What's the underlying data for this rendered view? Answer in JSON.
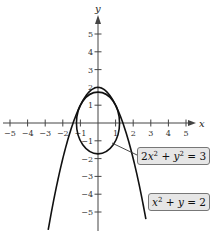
{
  "chart_data": {
    "type": "line",
    "title": "",
    "xlabel": "x",
    "ylabel": "y",
    "xlim": [
      -5,
      5
    ],
    "ylim": [
      -5,
      5
    ],
    "grid": false,
    "x_ticks": [
      -5,
      -4,
      -3,
      -2,
      -1,
      1,
      2,
      3,
      4,
      5
    ],
    "y_ticks": [
      5,
      4,
      3,
      2,
      1,
      -1,
      -2,
      -3,
      -4,
      -5
    ],
    "x_tick_labels": [
      "−5",
      "−4",
      "−3",
      "−2",
      "−1",
      "1",
      "2",
      "3",
      "4",
      "5"
    ],
    "y_tick_labels": [
      "5",
      "4",
      "3",
      "2",
      "1",
      "−1",
      "−2",
      "−3",
      "−4",
      "−5"
    ],
    "series": [
      {
        "name": "ellipse",
        "equation": "2x^2 + y^2 = 3",
        "kind": "ellipse",
        "semi_axis_x": 1.2247,
        "semi_axis_y": 1.7321
      },
      {
        "name": "parabola",
        "equation": "x^2 + y = 2",
        "kind": "parabola",
        "vertex": [
          0,
          2
        ],
        "x_range": [
          -2.83,
          2.72
        ]
      }
    ],
    "intersections": [
      [
        -1,
        1
      ],
      [
        1,
        1
      ]
    ],
    "annotations": [
      {
        "text": "2x² + y² = 3",
        "target": "ellipse"
      },
      {
        "text": "x² + y = 2",
        "target": "parabola"
      }
    ]
  },
  "labels": {
    "x_axis": "x",
    "y_axis": "y",
    "ellipse_label": {
      "a": "2",
      "x": "x",
      "exp1": "2",
      "plus": " + ",
      "y": "y",
      "exp2": "2",
      "rhs": " = 3"
    },
    "parabola_label": {
      "x": "x",
      "exp": "2",
      "plus": " + ",
      "y": "y",
      "rhs": " = 2"
    }
  },
  "colors": {
    "curve": "#111111",
    "axis": "#444444",
    "label_bg": "#e6e6e6"
  }
}
